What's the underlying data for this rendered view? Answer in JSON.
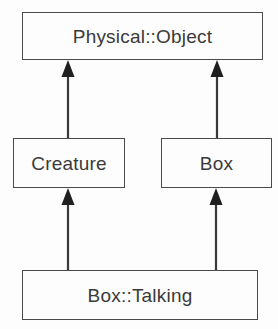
{
  "diagram": {
    "type": "class-inheritance-diagram",
    "notation": "UML generalization",
    "background_color": "#fdfdfd",
    "line_color": "#3a3a3a",
    "border_color": "#4a4a4a",
    "text_color": "#3a3a3a",
    "classes": [
      {
        "id": "physical-object",
        "label": "Physical::Object",
        "x": 22,
        "y": 12,
        "width": 241,
        "height": 48
      },
      {
        "id": "creature",
        "label": "Creature",
        "x": 13,
        "y": 138,
        "width": 112,
        "height": 50
      },
      {
        "id": "box",
        "label": "Box",
        "x": 161,
        "y": 138,
        "width": 111,
        "height": 50
      },
      {
        "id": "box-talking",
        "label": "Box::Talking",
        "x": 22,
        "y": 270,
        "width": 236,
        "height": 50
      }
    ],
    "relations": [
      {
        "id": "creature-to-physical-object",
        "kind": "generalization",
        "from": "Creature",
        "to": "Physical::Object",
        "arrowhead": "solid-triangle",
        "x": 68,
        "y_from": 138,
        "y_to": 60
      },
      {
        "id": "box-to-physical-object",
        "kind": "generalization",
        "from": "Box",
        "to": "Physical::Object",
        "arrowhead": "solid-triangle",
        "x": 217,
        "y_from": 138,
        "y_to": 60
      },
      {
        "id": "box-talking-to-creature",
        "kind": "generalization",
        "from": "Box::Talking",
        "to": "Creature",
        "arrowhead": "solid-triangle",
        "x": 68,
        "y_from": 270,
        "y_to": 188
      },
      {
        "id": "box-talking-to-box",
        "kind": "generalization",
        "from": "Box::Talking",
        "to": "Box",
        "arrowhead": "solid-triangle",
        "x": 216,
        "y_from": 270,
        "y_to": 188
      }
    ]
  }
}
